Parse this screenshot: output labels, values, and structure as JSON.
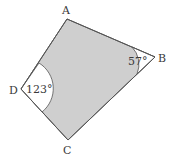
{
  "diagram": {
    "type": "quadrilateral",
    "colors": {
      "fill": "#cfcfcf",
      "stroke": "#555555",
      "text": "#3a3a3a",
      "background": "#ffffff"
    },
    "vertices": [
      {
        "name": "A",
        "label": "A"
      },
      {
        "name": "B",
        "label": "B"
      },
      {
        "name": "C",
        "label": "C"
      },
      {
        "name": "D",
        "label": "D"
      }
    ],
    "angles": [
      {
        "vertex": "B",
        "label": "57°"
      },
      {
        "vertex": "D",
        "label": "123°"
      }
    ]
  }
}
